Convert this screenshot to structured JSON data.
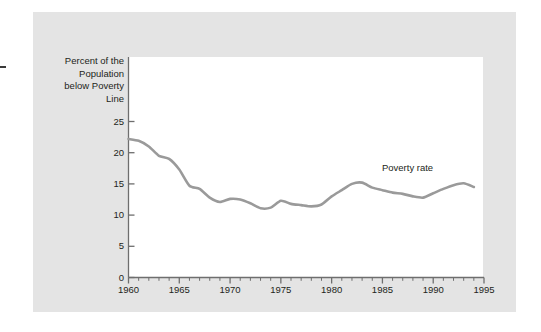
{
  "figure": {
    "background_color": "#ffffff",
    "panel_color": "#e4e4e4",
    "plot_color": "#ffffff",
    "axis_color": "#6e6e6e",
    "line_color": "#9a9a9a",
    "text_color": "#231f20"
  },
  "chart_data": {
    "type": "line",
    "title": "",
    "xlabel": "",
    "ylabel": "Percent of the\nPopulation\nbelow Poverty\nLine",
    "ylabel_lines": [
      "Percent of the",
      "Population",
      "below Poverty",
      "Line"
    ],
    "xlim": [
      1960,
      1995
    ],
    "ylim": [
      0,
      25
    ],
    "grid": false,
    "legend_position": "inline-annotation",
    "xticks": [
      1960,
      1965,
      1970,
      1975,
      1980,
      1985,
      1990,
      1995
    ],
    "xtick_labels": [
      "1960",
      "1965",
      "1970",
      "1975",
      "1980",
      "1985",
      "1990",
      "1995"
    ],
    "yticks": [
      0,
      5,
      10,
      15,
      20,
      25
    ],
    "ytick_labels": [
      "0",
      "5",
      "10",
      "15",
      "20",
      "25"
    ],
    "x_minor_ticks": [
      1961,
      1962,
      1963,
      1964,
      1966,
      1967,
      1968,
      1969,
      1971,
      1972,
      1973,
      1974,
      1976,
      1977,
      1978,
      1979,
      1981,
      1982,
      1983,
      1984,
      1986,
      1987,
      1988,
      1989,
      1991,
      1992,
      1993,
      1994
    ],
    "annotations": [
      {
        "text": "Poverty rate",
        "x": 1988.2,
        "y": 17.6
      }
    ],
    "series": [
      {
        "name": "Poverty rate",
        "color": "#9a9a9a",
        "x": [
          1960,
          1961,
          1962,
          1963,
          1964,
          1965,
          1966,
          1967,
          1968,
          1969,
          1970,
          1971,
          1972,
          1973,
          1974,
          1975,
          1976,
          1977,
          1978,
          1979,
          1980,
          1981,
          1982,
          1983,
          1984,
          1985,
          1986,
          1987,
          1988,
          1989,
          1990,
          1991,
          1992,
          1993,
          1994
        ],
        "values": [
          22.2,
          21.9,
          21.0,
          19.5,
          19.0,
          17.3,
          14.7,
          14.2,
          12.8,
          12.1,
          12.6,
          12.5,
          11.9,
          11.1,
          11.2,
          12.3,
          11.8,
          11.6,
          11.4,
          11.7,
          13.0,
          14.0,
          15.0,
          15.2,
          14.4,
          14.0,
          13.6,
          13.4,
          13.0,
          12.8,
          13.5,
          14.2,
          14.8,
          15.1,
          14.5
        ]
      }
    ]
  }
}
